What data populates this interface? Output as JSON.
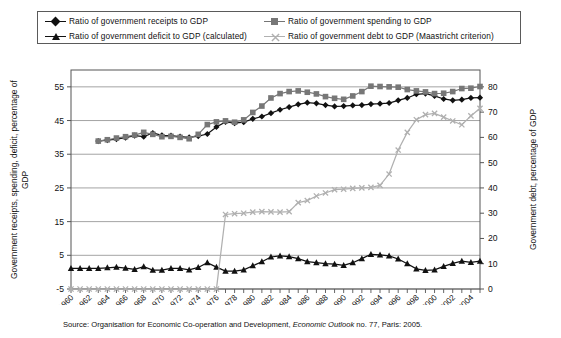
{
  "legend": {
    "items": [
      {
        "label": "Ratio of government receipts to GDP",
        "marker": "diamond-marker-icon",
        "color": "#111111",
        "row": 1,
        "col": 1
      },
      {
        "label": "Ratio of government spending to GDP",
        "marker": "square-marker-icon",
        "color": "#777777",
        "row": 1,
        "col": 2
      },
      {
        "label": "Ratio of government deficit to GDP (calculated)",
        "marker": "triangle-marker-icon",
        "color": "#111111",
        "row": 2,
        "col": 1
      },
      {
        "label": "Ratio of government debt to GDP (Maastricht criterion)",
        "marker": "x-marker-icon",
        "color": "#b0b0b0",
        "row": 2,
        "col": 2
      }
    ]
  },
  "axes": {
    "left_title": "Government receipts, spending, deficit, percentage of GDP",
    "right_title": "Government debt, percentage of GDP",
    "left_ticks": [
      -5,
      5,
      15,
      25,
      35,
      45,
      55
    ],
    "right_ticks": [
      0,
      10,
      20,
      30,
      40,
      50,
      60,
      70,
      80
    ],
    "left_range": [
      -5,
      60
    ],
    "right_range": [
      0,
      86.67
    ],
    "x_range": [
      1960,
      2005
    ],
    "x_tick_labels": [
      "1960",
      "1962",
      "1964",
      "1966",
      "1968",
      "1970",
      "1972",
      "1974",
      "1976",
      "1978",
      "1980",
      "1982",
      "1984",
      "1986",
      "1988",
      "1990",
      "1992",
      "1994",
      "1996",
      "1998",
      "2000",
      "2002",
      "2004"
    ]
  },
  "source": {
    "prefix": "Source: Organisation for Economic Co-operation and Development, ",
    "italic": "Economic Outlook",
    "suffix": " no. 77, Paris: 2005."
  },
  "chart_data": {
    "type": "line",
    "title": "",
    "xlabel": "",
    "ylabel": "Government receipts, spending, deficit, percentage of GDP",
    "y2label": "Government debt, percentage of GDP",
    "ylim": [
      -5,
      60
    ],
    "y2lim": [
      0,
      86.67
    ],
    "xlim": [
      1960,
      2005
    ],
    "grid": true,
    "legend_position": "top",
    "x": [
      1960,
      1961,
      1962,
      1963,
      1964,
      1965,
      1966,
      1967,
      1968,
      1969,
      1970,
      1971,
      1972,
      1973,
      1974,
      1975,
      1976,
      1977,
      1978,
      1979,
      1980,
      1981,
      1982,
      1983,
      1984,
      1985,
      1986,
      1987,
      1988,
      1989,
      1990,
      1991,
      1992,
      1993,
      1994,
      1995,
      1996,
      1997,
      1998,
      1999,
      2000,
      2001,
      2002,
      2003,
      2004,
      2005
    ],
    "series": [
      {
        "name": "Ratio of government receipts to GDP",
        "axis": "left",
        "marker": "diamond",
        "color": "#111111",
        "values": [
          null,
          null,
          null,
          38.9,
          39.2,
          39.5,
          39.9,
          40.5,
          40.2,
          41.3,
          40.6,
          40.5,
          40.2,
          40.0,
          40.4,
          41.0,
          43.1,
          44.6,
          44.2,
          44.5,
          45.5,
          46.2,
          47.2,
          48.2,
          49.0,
          49.8,
          50.3,
          50.1,
          49.6,
          49.2,
          49.3,
          49.5,
          49.6,
          49.9,
          50.0,
          50.2,
          51.0,
          51.7,
          52.8,
          53.0,
          52.3,
          51.4,
          51.0,
          51.2,
          51.7,
          51.8
        ]
      },
      {
        "name": "Ratio of government spending to GDP",
        "axis": "left",
        "marker": "square",
        "color": "#777777",
        "values": [
          null,
          null,
          null,
          38.9,
          39.3,
          39.8,
          40.2,
          40.7,
          41.5,
          40.9,
          40.2,
          40.3,
          40.0,
          39.6,
          40.9,
          43.8,
          44.6,
          44.9,
          44.5,
          45.2,
          47.4,
          49.3,
          51.7,
          53.0,
          53.6,
          53.8,
          53.4,
          52.9,
          52.1,
          51.6,
          51.3,
          52.3,
          53.6,
          55.2,
          55.1,
          55.0,
          54.9,
          54.2,
          53.8,
          53.5,
          53.0,
          53.1,
          53.6,
          54.5,
          54.6,
          55.1
        ]
      },
      {
        "name": "Ratio of government deficit to GDP (calculated)",
        "axis": "left",
        "marker": "triangle",
        "color": "#111111",
        "values": [
          1.1,
          1.1,
          1.1,
          1.1,
          1.3,
          1.5,
          1.2,
          0.8,
          1.6,
          0.6,
          0.6,
          1.1,
          1.1,
          0.7,
          1.4,
          2.8,
          1.5,
          0.3,
          0.3,
          0.7,
          1.9,
          3.1,
          4.5,
          4.8,
          4.6,
          4.0,
          3.1,
          2.8,
          2.5,
          2.4,
          2.0,
          2.8,
          4.0,
          5.3,
          5.1,
          4.8,
          3.9,
          2.5,
          1.0,
          0.5,
          0.7,
          1.7,
          2.6,
          3.3,
          2.9,
          3.3
        ]
      },
      {
        "name": "Ratio of government debt to GDP (Maastricht criterion)",
        "axis": "right",
        "marker": "x",
        "color": "#b0b0b0",
        "values": [
          0,
          0,
          0,
          0,
          0,
          0,
          0,
          0,
          0,
          0,
          0,
          0,
          0,
          0,
          0,
          0,
          0,
          29.5,
          29.8,
          30.0,
          30.4,
          30.6,
          30.5,
          30.4,
          30.6,
          34.2,
          35.0,
          36.8,
          38.0,
          39.3,
          39.5,
          39.8,
          40.0,
          40.2,
          41.0,
          45.5,
          55.0,
          62.0,
          67.0,
          69.0,
          69.5,
          68.0,
          66.5,
          65.0,
          68.5,
          71.5
        ]
      }
    ]
  }
}
